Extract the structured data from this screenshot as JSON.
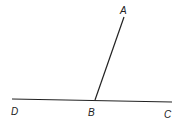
{
  "diagram": {
    "type": "geometry-angle",
    "points": {
      "A": {
        "label": "A",
        "x": 124,
        "y": 17
      },
      "B": {
        "label": "B",
        "x": 95,
        "y": 100
      },
      "C": {
        "label": "C",
        "x": 172,
        "y": 102
      },
      "D": {
        "label": "D",
        "x": 12,
        "y": 99
      }
    },
    "segments": [
      {
        "from": "D",
        "to": "C"
      },
      {
        "from": "B",
        "to": "A"
      }
    ],
    "line_color": "#222222"
  }
}
